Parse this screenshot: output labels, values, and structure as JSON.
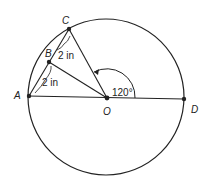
{
  "diagram": {
    "points": {
      "A": "A",
      "B": "B",
      "C": "C",
      "O": "O",
      "D": "D"
    },
    "measurements": {
      "bc_length": "2 in",
      "ab_length": "2 in",
      "angle_cod": "120°"
    },
    "colors": {
      "stroke": "#222222",
      "background": "#ffffff"
    }
  }
}
